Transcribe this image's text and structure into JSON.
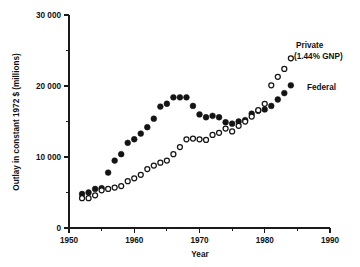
{
  "chart_data": {
    "type": "scatter",
    "title": "",
    "xlabel": "Year",
    "ylabel": "Outlay in constant 1972 $ (millions)",
    "xlim": [
      1950,
      1990
    ],
    "ylim": [
      0,
      30000
    ],
    "xticks": [
      1950,
      1960,
      1970,
      1980,
      1990
    ],
    "xticklabels": [
      "1950",
      "1960",
      "1970",
      "1980",
      "1990"
    ],
    "xminorticks": [
      1955,
      1965,
      1975,
      1985
    ],
    "yticks": [
      0,
      10000,
      20000,
      30000
    ],
    "yticklabels": [
      "0",
      "10 000",
      "20 000",
      "30 000"
    ],
    "yminorticks": [
      5000,
      15000,
      25000
    ],
    "grid": false,
    "legend_position": "inline-right-annotations",
    "series": [
      {
        "name": "Federal",
        "marker": "filled-circle",
        "color": "#141414",
        "annotation": "Federal",
        "x": [
          1952,
          1953,
          1954,
          1955,
          1956,
          1957,
          1958,
          1959,
          1960,
          1961,
          1962,
          1963,
          1964,
          1965,
          1966,
          1967,
          1968,
          1969,
          1970,
          1971,
          1972,
          1973,
          1974,
          1975,
          1976,
          1977,
          1978,
          1979,
          1980,
          1981,
          1982,
          1983,
          1984
        ],
        "y": [
          4800,
          5000,
          5500,
          5600,
          7800,
          9500,
          10400,
          12000,
          12500,
          13300,
          14200,
          15400,
          17100,
          17500,
          18400,
          18400,
          18400,
          17200,
          16000,
          15600,
          15800,
          15600,
          14900,
          14700,
          15000,
          15200,
          16100,
          16500,
          16700,
          17200,
          18100,
          19000,
          20100
        ]
      },
      {
        "name": "Private",
        "marker": "open-circle",
        "color": "#141414",
        "annotation": "Private",
        "annotation_sub": "(1.44% GNP)",
        "x": [
          1952,
          1953,
          1954,
          1955,
          1956,
          1957,
          1958,
          1959,
          1960,
          1961,
          1962,
          1963,
          1964,
          1965,
          1966,
          1967,
          1968,
          1969,
          1970,
          1971,
          1972,
          1973,
          1974,
          1975,
          1976,
          1977,
          1978,
          1979,
          1980,
          1981,
          1982,
          1983,
          1984
        ],
        "y": [
          4200,
          4200,
          4600,
          5300,
          5500,
          5700,
          5900,
          6600,
          7000,
          7500,
          8300,
          8800,
          9200,
          9500,
          10400,
          11400,
          12500,
          12600,
          12500,
          12400,
          13100,
          13400,
          14000,
          13600,
          14400,
          15000,
          15700,
          16600,
          17500,
          20100,
          21300,
          22400,
          23900
        ]
      }
    ]
  },
  "annotations": {
    "private_label": "Private",
    "private_sub": "(1.44% GNP)",
    "federal_label": "Federal"
  }
}
